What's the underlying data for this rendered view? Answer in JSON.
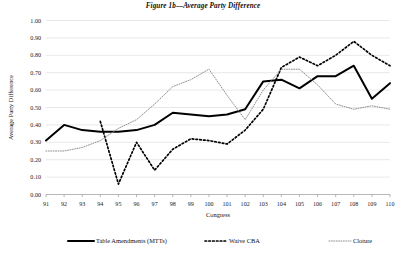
{
  "figure": {
    "title": "Figure 1b—Average Party Difference"
  },
  "chart_data": {
    "type": "line",
    "title": "Figure 1b—Average Party Difference",
    "xlabel": "Congress",
    "ylabel": "Average Party Difference",
    "xlim": [
      91,
      110
    ],
    "ylim": [
      0.0,
      1.0
    ],
    "grid": true,
    "legend_position": "bottom",
    "x": [
      91,
      92,
      93,
      94,
      95,
      96,
      97,
      98,
      99,
      100,
      101,
      102,
      103,
      104,
      105,
      106,
      107,
      108,
      109,
      110
    ],
    "x_tick_labels": [
      "91",
      "92",
      "93",
      "94",
      "95",
      "96",
      "97",
      "98",
      "99",
      "100",
      "101",
      "102",
      "103",
      "104",
      "105",
      "106",
      "107",
      "108",
      "109",
      "110"
    ],
    "y_tick_labels": [
      "0.00",
      "0.10",
      "0.20",
      "0.30",
      "0.40",
      "0.50",
      "0.60",
      "0.70",
      "0.80",
      "0.90",
      "1.00"
    ],
    "y_ticks": [
      0.0,
      0.1,
      0.2,
      0.3,
      0.4,
      0.5,
      0.6,
      0.7,
      0.8,
      0.9,
      1.0
    ],
    "series": [
      {
        "name": "Table Amendments (MTTs)",
        "style": "solid",
        "color": "#000000",
        "values": [
          0.31,
          0.4,
          0.37,
          0.36,
          0.36,
          0.37,
          0.4,
          0.47,
          0.46,
          0.45,
          0.46,
          0.49,
          0.65,
          0.66,
          0.61,
          0.68,
          0.68,
          0.74,
          0.55,
          0.64
        ]
      },
      {
        "name": "Waive CBA",
        "style": "dashed",
        "color": "#000000",
        "values": [
          null,
          null,
          null,
          0.42,
          0.06,
          0.3,
          0.14,
          0.26,
          0.32,
          0.31,
          0.29,
          0.37,
          0.49,
          0.73,
          0.79,
          0.74,
          0.8,
          0.88,
          0.8,
          0.74
        ]
      },
      {
        "name": "Cloture",
        "style": "dotted",
        "color": "#8d8d8d",
        "values": [
          0.25,
          0.25,
          0.27,
          0.31,
          0.38,
          0.43,
          0.52,
          0.62,
          0.66,
          0.72,
          0.57,
          0.43,
          0.6,
          0.72,
          0.72,
          0.63,
          0.52,
          0.49,
          0.51,
          0.49
        ]
      }
    ]
  },
  "legend": {
    "items": [
      {
        "label": "Table Amendments (MTTs)",
        "style": "solid"
      },
      {
        "label": "Waive CBA",
        "style": "dashed"
      },
      {
        "label": "Cloture",
        "style": "dotted"
      }
    ]
  }
}
